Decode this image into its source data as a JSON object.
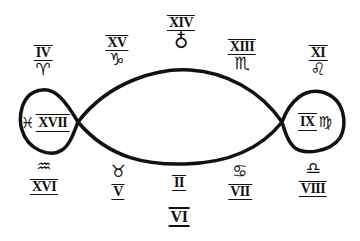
{
  "diagram": {
    "type": "lemniscate",
    "stroke_color": "#111111",
    "left_loop": {
      "numeral": "XVII",
      "glyph": "♓",
      "glyph_name": "pisces"
    },
    "right_loop": {
      "numeral": "IX",
      "glyph": "♍",
      "glyph_name": "virgo"
    },
    "top": [
      {
        "numeral": "IV",
        "glyph": "♈",
        "glyph_name": "aries"
      },
      {
        "numeral": "XV",
        "glyph": "♑",
        "glyph_name": "capricorn"
      },
      {
        "numeral": "XIV",
        "glyph": "♁",
        "glyph_name": "earth-cross"
      },
      {
        "numeral": "XIII",
        "glyph": "♏",
        "glyph_name": "scorpio"
      },
      {
        "numeral": "XI",
        "glyph": "♌",
        "glyph_name": "leo"
      }
    ],
    "bottom": [
      {
        "numeral": "XVI",
        "glyph": "♒",
        "glyph_name": "aquarius"
      },
      {
        "numeral": "V",
        "glyph": "♉",
        "glyph_name": "taurus"
      },
      {
        "numeral": "II",
        "glyph": "",
        "glyph_name": ""
      },
      {
        "numeral": "VI",
        "glyph": "",
        "glyph_name": ""
      },
      {
        "numeral": "VII",
        "glyph": "♋",
        "glyph_name": "cancer"
      },
      {
        "numeral": "VIII",
        "glyph": "♎",
        "glyph_name": "libra"
      }
    ]
  }
}
